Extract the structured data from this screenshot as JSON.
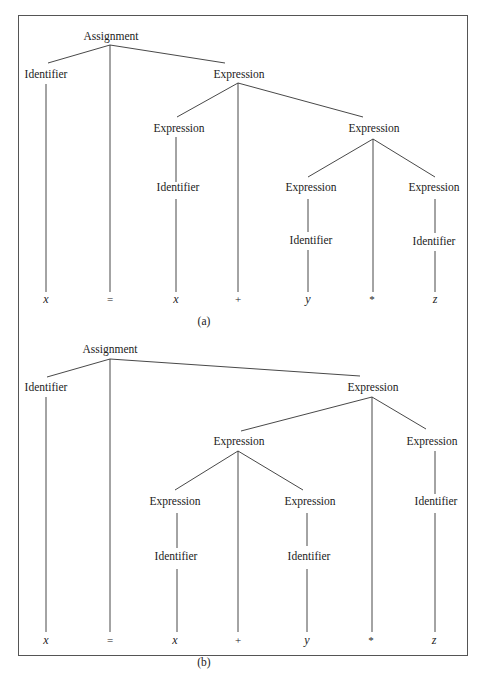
{
  "figure": {
    "trees": [
      {
        "caption": "(a)",
        "nodes": {
          "root": "Assignment",
          "id_lhs": "Identifier",
          "expr_top": "Expression",
          "expr_left": "Expression",
          "id_left": "Identifier",
          "expr_right": "Expression",
          "expr_rr_left": "Expression",
          "id_rr_left": "Identifier",
          "expr_rr_right": "Expression",
          "id_rr_right": "Identifier"
        },
        "leaves": [
          "x",
          "=",
          "x",
          "+",
          "y",
          "*",
          "z"
        ]
      },
      {
        "caption": "(b)",
        "nodes": {
          "root": "Assignment",
          "id_lhs": "Identifier",
          "expr_top": "Expression",
          "expr_left": "Expression",
          "expr_ll": "Expression",
          "id_ll": "Identifier",
          "expr_lr": "Expression",
          "id_lr": "Identifier",
          "expr_right": "Expression",
          "id_right": "Identifier"
        },
        "leaves": [
          "x",
          "=",
          "x",
          "+",
          "y",
          "*",
          "z"
        ]
      }
    ]
  }
}
